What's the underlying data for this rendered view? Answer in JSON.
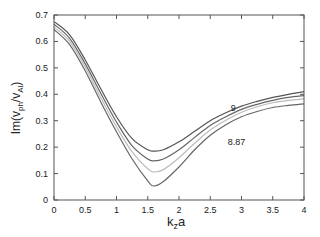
{
  "chart_data": {
    "type": "line",
    "title": "",
    "xlabel": "k_z a",
    "ylabel": "Im(v_ph/v_A)",
    "xlim": [
      0,
      4
    ],
    "ylim": [
      0,
      0.7
    ],
    "grid": false,
    "xticks": [
      "0",
      "0.5",
      "1",
      "1.5",
      "2",
      "2.5",
      "3",
      "3.5",
      "4"
    ],
    "yticks": [
      "0",
      "0.1",
      "0.2",
      "0.3",
      "0.4",
      "0.5",
      "0.6",
      "0.7"
    ],
    "annotations": [
      {
        "text": "9",
        "x": 2.87,
        "y": 0.335
      },
      {
        "text": "8.87",
        "x": 2.92,
        "y": 0.21
      }
    ],
    "x": [
      0,
      0.25,
      0.5,
      0.75,
      1.0,
      1.25,
      1.5,
      1.6,
      1.75,
      2.0,
      2.25,
      2.5,
      2.75,
      3.0,
      3.25,
      3.5,
      3.75,
      4.0
    ],
    "series": [
      {
        "name": "9",
        "color": "#555555",
        "values": [
          0.675,
          0.625,
          0.53,
          0.42,
          0.315,
          0.232,
          0.19,
          0.185,
          0.19,
          0.22,
          0.26,
          0.3,
          0.33,
          0.355,
          0.373,
          0.388,
          0.4,
          0.41
        ]
      },
      {
        "name": "curve-2",
        "color": "#666666",
        "values": [
          0.665,
          0.612,
          0.515,
          0.403,
          0.295,
          0.205,
          0.155,
          0.148,
          0.155,
          0.19,
          0.237,
          0.282,
          0.315,
          0.343,
          0.362,
          0.377,
          0.388,
          0.395
        ]
      },
      {
        "name": "curve-3",
        "color": "#bbbbbb",
        "values": [
          0.655,
          0.6,
          0.502,
          0.387,
          0.277,
          0.182,
          0.118,
          0.106,
          0.115,
          0.16,
          0.215,
          0.265,
          0.302,
          0.332,
          0.353,
          0.368,
          0.377,
          0.383
        ]
      },
      {
        "name": "8.87",
        "color": "#666666",
        "values": [
          0.645,
          0.588,
          0.488,
          0.37,
          0.258,
          0.155,
          0.072,
          0.053,
          0.07,
          0.125,
          0.19,
          0.245,
          0.285,
          0.315,
          0.335,
          0.35,
          0.358,
          0.364
        ]
      }
    ]
  }
}
